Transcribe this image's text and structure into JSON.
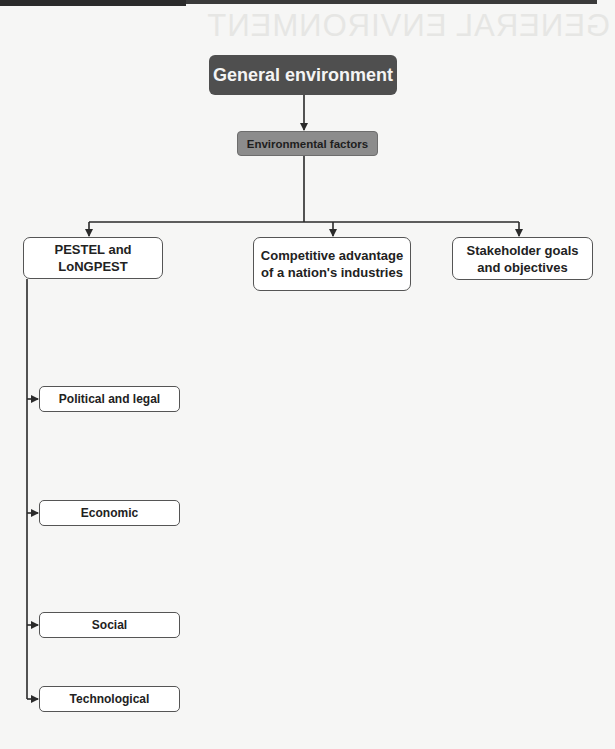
{
  "page": {
    "background_heading_mirrored": "GENERAL ENVIRONMENT"
  },
  "diagram": {
    "root": {
      "label": "General environment",
      "color": "#4f4f4f"
    },
    "factors": {
      "label": "Environmental factors",
      "color": "#8c8c8c"
    },
    "branches": [
      {
        "label": "PESTEL and LoNGPEST"
      },
      {
        "label": "Competitive advantage of a nation's industries"
      },
      {
        "label": "Stakeholder goals and objectives"
      }
    ],
    "pestel_children": [
      {
        "label": "Political and legal"
      },
      {
        "label": "Economic"
      },
      {
        "label": "Social"
      },
      {
        "label": "Technological"
      }
    ]
  }
}
